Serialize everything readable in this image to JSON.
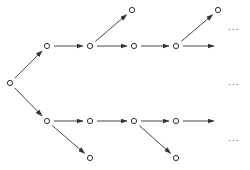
{
  "diagram": {
    "type": "branching-tree",
    "colors": {
      "stroke": "#333333",
      "background": "#ffffff"
    },
    "nodes": [
      {
        "id": "root",
        "x": 10,
        "y": 83
      },
      {
        "id": "u1",
        "x": 47,
        "y": 46
      },
      {
        "id": "u2",
        "x": 90,
        "y": 46
      },
      {
        "id": "u3",
        "x": 134,
        "y": 46
      },
      {
        "id": "u4",
        "x": 176,
        "y": 46
      },
      {
        "id": "t1",
        "x": 132,
        "y": 10
      },
      {
        "id": "t2",
        "x": 218,
        "y": 10
      },
      {
        "id": "l1",
        "x": 47,
        "y": 121
      },
      {
        "id": "l2",
        "x": 90,
        "y": 121
      },
      {
        "id": "l3",
        "x": 134,
        "y": 121
      },
      {
        "id": "l4",
        "x": 176,
        "y": 121
      },
      {
        "id": "b1",
        "x": 90,
        "y": 158
      },
      {
        "id": "b2",
        "x": 176,
        "y": 158
      }
    ],
    "edges": [
      {
        "from": "root",
        "to": "u1"
      },
      {
        "from": "root",
        "to": "l1"
      },
      {
        "from": "u1",
        "to": "u2"
      },
      {
        "from": "u2",
        "to": "u3"
      },
      {
        "from": "u2",
        "to": "t1"
      },
      {
        "from": "u3",
        "to": "u4"
      },
      {
        "from": "u4",
        "to": "t2"
      },
      {
        "from": "u4",
        "to": "open-upper"
      },
      {
        "from": "l1",
        "to": "l2"
      },
      {
        "from": "l1",
        "to": "b1"
      },
      {
        "from": "l2",
        "to": "l3"
      },
      {
        "from": "l3",
        "to": "l4"
      },
      {
        "from": "l3",
        "to": "b2"
      },
      {
        "from": "l4",
        "to": "open-lower"
      }
    ],
    "open_ends": {
      "open-upper": {
        "x": 214,
        "y": 46
      },
      "open-lower": {
        "x": 214,
        "y": 121
      }
    },
    "ellipses": [
      {
        "text": "...",
        "x": 228,
        "y": 30
      },
      {
        "text": "...",
        "x": 228,
        "y": 85
      },
      {
        "text": "...",
        "x": 228,
        "y": 141
      }
    ]
  }
}
